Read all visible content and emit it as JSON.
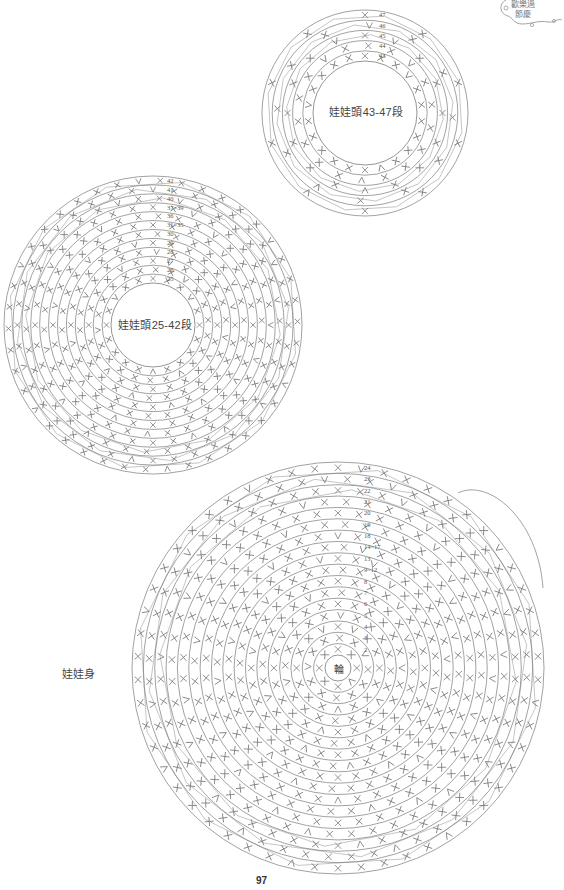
{
  "page": {
    "number": "97",
    "background": "#ffffff",
    "line_color": "#8a8a8a"
  },
  "badge": {
    "line1": "歡樂過",
    "line2": "節慶",
    "icon": "decorative-swirl-frame"
  },
  "charts": [
    {
      "id": "head-43-47",
      "title": "娃娃頭43-47段",
      "cx": 365,
      "cy": 113,
      "inner_r": 52,
      "outer_r": 103,
      "rows": [
        "43",
        "44",
        "45",
        "46",
        "47"
      ],
      "label_x_offset": 14,
      "stitch_symbol": "single-crochet-x",
      "stitches_per_ring": [
        22,
        18,
        16,
        12,
        10
      ]
    },
    {
      "id": "head-25-42",
      "title": "娃娃頭25-42段",
      "cx": 153,
      "cy": 325,
      "inner_r": 42,
      "outer_r": 149,
      "rows": [
        "25",
        "26",
        "27",
        "28",
        "29",
        "30",
        "31~35",
        "36",
        "37~39",
        "40",
        "41",
        "42"
      ],
      "label_x_offset": 14,
      "stitch_symbol": "single-crochet-x",
      "stitches_per_ring": [
        20,
        22,
        24,
        26,
        28,
        30,
        32,
        34,
        36,
        38,
        40,
        42
      ]
    },
    {
      "id": "body",
      "title": "娃娃身",
      "center_text": "輪",
      "cx": 338,
      "cy": 668,
      "inner_r": 13,
      "outer_r": 206,
      "rows": [
        "2",
        "3",
        "4",
        "5",
        "6",
        "7",
        "8",
        "9~12",
        "13",
        "14~17",
        "18",
        "19",
        "20",
        "21",
        "22",
        "23",
        "24"
      ],
      "label_x_offset": 26,
      "stitch_symbol": "single-crochet-x",
      "stitches_per_ring": [
        8,
        12,
        16,
        20,
        24,
        28,
        32,
        36,
        38,
        40,
        42,
        44,
        46,
        48,
        50,
        52,
        54
      ]
    }
  ],
  "labels": {
    "head_top": "娃娃頭43-47段",
    "head_mid": "娃娃頭25-42段",
    "body_side": "娃娃身",
    "body_center": "輪"
  }
}
